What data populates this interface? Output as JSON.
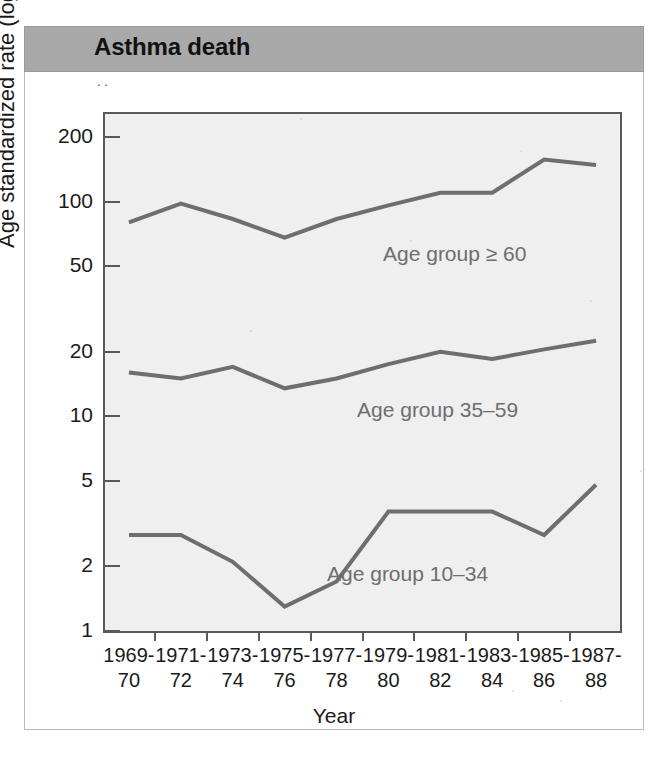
{
  "card": {
    "title": "Asthma death"
  },
  "chart_data": {
    "type": "line",
    "title": "Asthma death",
    "xlabel": "Year",
    "ylabel": "Age standardized rate (log scale)",
    "yscale": "log",
    "ylim": [
      1,
      260
    ],
    "yticks": [
      1,
      2,
      5,
      10,
      20,
      50,
      100,
      200
    ],
    "ytick_labels": [
      "1",
      "2",
      "5",
      "10",
      "20",
      "50",
      "100",
      "200"
    ],
    "grid": false,
    "legend_position": "inline-annotation",
    "categories": [
      "1969-70",
      "1971-72",
      "1973-74",
      "1975-76",
      "1977-78",
      "1979-80",
      "1981-82",
      "1983-84",
      "1985-86",
      "1987-88"
    ],
    "xtick_lines": [
      [
        "1969-",
        "70"
      ],
      [
        "1971-",
        "72"
      ],
      [
        "1973-",
        "74"
      ],
      [
        "1975-",
        "76"
      ],
      [
        "1977-",
        "78"
      ],
      [
        "1979-",
        "80"
      ],
      [
        "1981-",
        "82"
      ],
      [
        "1983-",
        "84"
      ],
      [
        "1985-",
        "86"
      ],
      [
        "1987-",
        "88"
      ]
    ],
    "series": [
      {
        "name": "Age group > 60",
        "label": "Age group ≥ 60",
        "color": "#6e6e6e",
        "values": [
          80,
          98,
          83,
          68,
          83,
          96,
          110,
          110,
          157,
          148
        ]
      },
      {
        "name": "Age group 35-59",
        "label": "Age group 35–59",
        "color": "#6e6e6e",
        "values": [
          16.0,
          15.0,
          17.0,
          13.5,
          15.0,
          17.5,
          20.0,
          18.5,
          20.5,
          22.5
        ]
      },
      {
        "name": "Age group 10-34",
        "label": "Age group 10–34",
        "color": "#6e6e6e",
        "values": [
          2.8,
          2.8,
          2.1,
          1.3,
          1.7,
          3.6,
          3.6,
          3.6,
          2.8,
          4.8
        ]
      }
    ]
  }
}
